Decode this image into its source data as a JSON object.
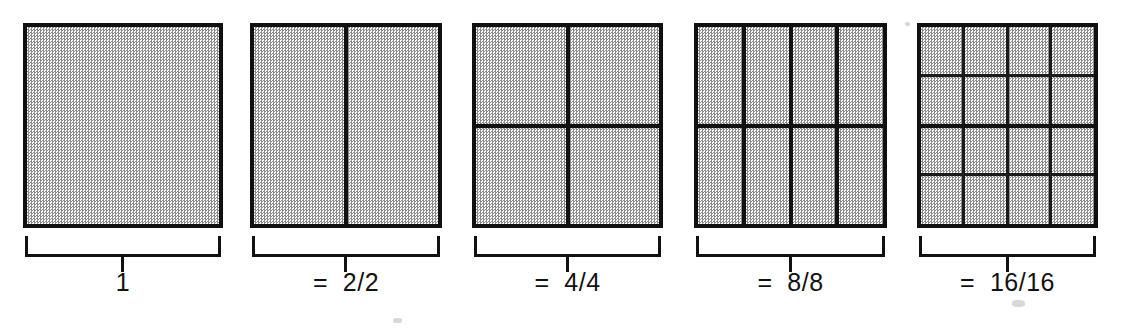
{
  "figure": {
    "title_visible": false,
    "background_color": "#ffffff",
    "ink_color": "#111111",
    "fill_color": "#e9e9e9",
    "groups": [
      {
        "id": "whole",
        "caption": "1",
        "columns": 1,
        "rows": 1,
        "parts": 1,
        "square": {
          "x": 23,
          "y": 23,
          "w": 200,
          "h": 205
        },
        "bracket": {
          "x": 25,
          "y": 236,
          "w": 196
        },
        "caption_pos": {
          "x": 25,
          "y": 268,
          "w": 196
        }
      },
      {
        "id": "halves",
        "caption": "=  2/2",
        "columns": 2,
        "rows": 1,
        "parts": 2,
        "square": {
          "x": 250,
          "y": 23,
          "w": 192,
          "h": 205
        },
        "bracket": {
          "x": 252,
          "y": 236,
          "w": 188
        },
        "caption_pos": {
          "x": 252,
          "y": 268,
          "w": 188
        }
      },
      {
        "id": "quarters",
        "caption": "=  4/4",
        "columns": 2,
        "rows": 2,
        "parts": 4,
        "square": {
          "x": 472,
          "y": 23,
          "w": 191,
          "h": 205
        },
        "bracket": {
          "x": 474,
          "y": 236,
          "w": 187
        },
        "caption_pos": {
          "x": 474,
          "y": 268,
          "w": 187
        }
      },
      {
        "id": "eighths",
        "caption": "=  8/8",
        "columns": 4,
        "rows": 2,
        "parts": 8,
        "square": {
          "x": 694,
          "y": 23,
          "w": 193,
          "h": 205
        },
        "bracket": {
          "x": 696,
          "y": 236,
          "w": 189
        },
        "caption_pos": {
          "x": 696,
          "y": 268,
          "w": 189
        }
      },
      {
        "id": "sixteenths",
        "caption": "=  16/16",
        "columns": 4,
        "rows": 4,
        "parts": 16,
        "square": {
          "x": 917,
          "y": 23,
          "w": 181,
          "h": 205
        },
        "bracket": {
          "x": 919,
          "y": 236,
          "w": 177
        },
        "caption_pos": {
          "x": 919,
          "y": 268,
          "w": 177
        }
      }
    ]
  },
  "chart_data": {
    "type": "bar",
    "xlabel": "",
    "ylabel": "",
    "categories": [
      "1",
      "= 2/2",
      "= 4/4",
      "= 8/8",
      "= 16/16"
    ],
    "values": [
      1,
      1,
      1,
      1,
      1
    ],
    "annotations": [
      "1 whole square, undivided",
      "square split into 2 equal vertical parts = 2/2",
      "square split into a 2 x 2 grid = 4/4",
      "square split into 4 columns x 2 rows = 8/8",
      "square split into a 4 x 4 grid = 16/16"
    ],
    "grid": false,
    "legend_position": "none",
    "ylim": [
      0,
      1
    ]
  }
}
